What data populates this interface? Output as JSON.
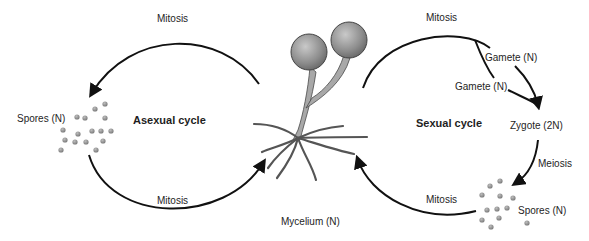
{
  "diagram": {
    "center_label": "Mycelium (N)",
    "asexual": {
      "title": "Asexual cycle",
      "top_step": "Mitosis",
      "bottom_step": "Mitosis",
      "spores": "Spores (N)"
    },
    "sexual": {
      "title": "Sexual cycle",
      "top_step": "Mitosis",
      "gamete_1": "Gamete (N)",
      "gamete_2": "Gamete (N)",
      "zygote": "Zygote (2N)",
      "meiosis": "Meiosis",
      "spores": "Spores (N)",
      "bottom_step": "Mitosis"
    },
    "colors": {
      "line": "#111111",
      "spore": "#8a8a8a",
      "sporangium": "#8c8c8c",
      "hypha": "#9a9a9a"
    }
  }
}
